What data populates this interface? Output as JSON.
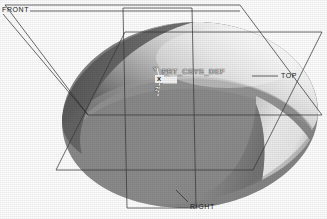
{
  "viewport": {
    "name": "cad-3d-viewport",
    "background_color": "#ffffff",
    "model_type": "shaded-solid-revolve"
  },
  "datum_planes": [
    {
      "id": "front",
      "label": "FRONT",
      "leader": true
    },
    {
      "id": "top",
      "label": "TOP",
      "leader": true
    },
    {
      "id": "right",
      "label": "RIGHT",
      "leader": true
    }
  ],
  "coordinate_system": {
    "name_label": "PRT_CSYS_DEF",
    "axes": [
      {
        "id": "y",
        "label": "Y"
      },
      {
        "id": "x",
        "label": "X"
      },
      {
        "id": "z",
        "label": "Z"
      }
    ]
  },
  "colors": {
    "line": "#3a3a3a",
    "label_text": "#1a1a1a",
    "csys_text": "#f2f2f2",
    "surface_highlight": "#fbfbfb",
    "surface_light": "#d2d2d2",
    "surface_mid": "#8a8a8a",
    "surface_dark": "#6e6e6e",
    "surface_darkest": "#5a5a5a",
    "chamfer_bright": "#f0f0f0",
    "side_wall": "#8f8f8f",
    "background": "#ffffff"
  }
}
